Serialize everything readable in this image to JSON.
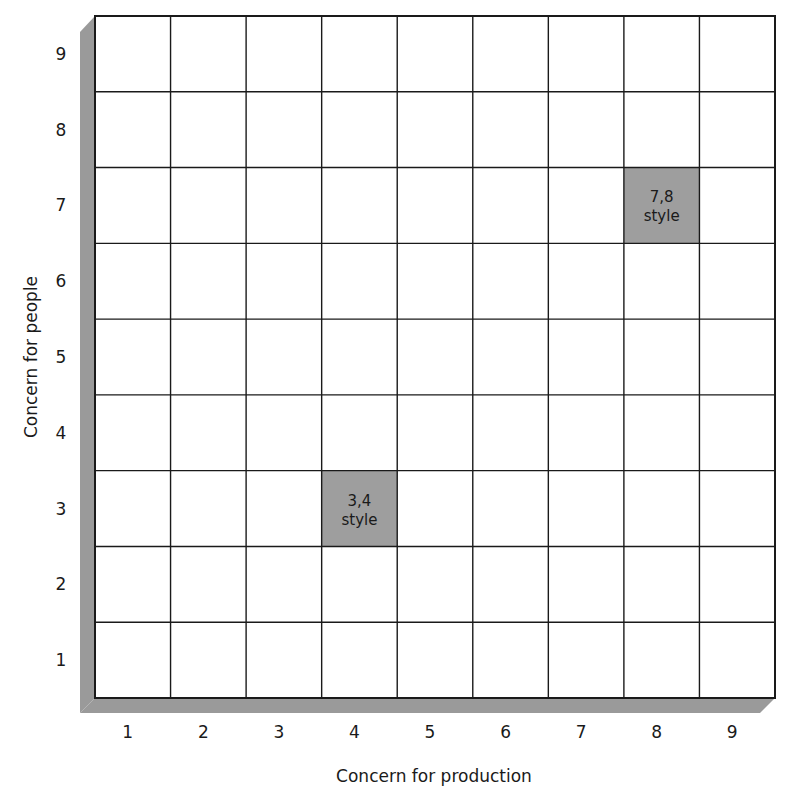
{
  "x_axis": {
    "label": "Concern for production",
    "ticks": [
      "1",
      "2",
      "3",
      "4",
      "5",
      "6",
      "7",
      "8",
      "9"
    ]
  },
  "y_axis": {
    "label": "Concern for people",
    "ticks": [
      "1",
      "2",
      "3",
      "4",
      "5",
      "6",
      "7",
      "8",
      "9"
    ]
  },
  "highlights": [
    {
      "id": "style-3-4",
      "line1": "3,4",
      "line2": "style",
      "x": 4,
      "y": 3,
      "color": "#9e9e9e"
    },
    {
      "id": "style-7-8",
      "line1": "7,8",
      "line2": "style",
      "x": 8,
      "y": 7,
      "color": "#9e9e9e"
    }
  ],
  "colors": {
    "grid": "#1a1a1a",
    "shadow": "#9a9a9a",
    "highlight": "#9e9e9e",
    "background": "#ffffff"
  },
  "chart_data": {
    "type": "heatmap",
    "title": "",
    "xlabel": "Concern for production",
    "ylabel": "Concern for people",
    "x": [
      1,
      2,
      3,
      4,
      5,
      6,
      7,
      8,
      9
    ],
    "y": [
      1,
      2,
      3,
      4,
      5,
      6,
      7,
      8,
      9
    ],
    "xlim": [
      0.5,
      9.5
    ],
    "ylim": [
      0.5,
      9.5
    ],
    "grid": true,
    "legend": null,
    "annotations": [
      {
        "x": 4,
        "y": 3,
        "text": "3,4 style",
        "shaded": true
      },
      {
        "x": 8,
        "y": 7,
        "text": "7,8 style",
        "shaded": true
      }
    ]
  }
}
